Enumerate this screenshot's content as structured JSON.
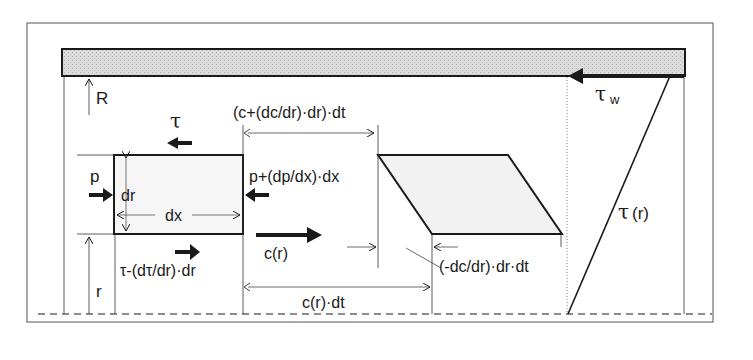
{
  "diagram": {
    "labels": {
      "R": "R",
      "tau": "τ",
      "tau_w": "τ",
      "tau_w_sub": "w",
      "p": "p",
      "dr": "dr",
      "dx": "dx",
      "p_plus": "p+(dp/dx)·dx",
      "c_plus": "(c+(dc/dr)·dr)·dt",
      "c_r": "c(r)",
      "tau_minus": "τ-(dτ/dr)·dr",
      "r": "r",
      "c_r_dt": "c(r)·dt",
      "dc_dr": "(-dc/dr)·dr·dt",
      "tau_r": "τ(r)"
    },
    "colors": {
      "line": "#1a1a1a",
      "wall_fill": "#d6d6d6",
      "element_fill": "#f4f4f4",
      "frame": "#555555"
    }
  }
}
